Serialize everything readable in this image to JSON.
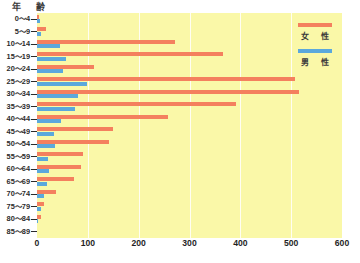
{
  "chart_data": {
    "type": "bar",
    "orientation": "horizontal",
    "title": "",
    "xlabel": "",
    "ylabel": "年　齢",
    "categories": [
      "0～4",
      "5～9",
      "10～14",
      "15～19",
      "20～24",
      "25～29",
      "30～34",
      "35～39",
      "40～44",
      "45～49",
      "50～54",
      "55～59",
      "60～64",
      "65～69",
      "70～74",
      "75～79",
      "80～84",
      "85～89"
    ],
    "series": [
      {
        "name": "女　性",
        "color": "#F4805E",
        "values": [
          4,
          18,
          272,
          365,
          113,
          508,
          515,
          392,
          258,
          150,
          142,
          90,
          87,
          72,
          38,
          14,
          7,
          0
        ]
      },
      {
        "name": "男　性",
        "color": "#5BA8DC",
        "values": [
          6,
          7,
          46,
          57,
          52,
          98,
          81,
          74,
          47,
          33,
          36,
          22,
          24,
          19,
          13,
          8,
          1,
          0
        ]
      }
    ],
    "xlim": [
      0,
      600
    ],
    "xticks": [
      0,
      100,
      200,
      300,
      400,
      500,
      600
    ],
    "xtick_labels": [
      "0",
      "100",
      "200",
      "300",
      "400",
      "500",
      "600"
    ],
    "grid": true,
    "grid_axis": "x",
    "grid_color": "#ffffff",
    "plot_background": "#FAF8A8",
    "legend_position": "top-right"
  },
  "axis": {
    "age_caption": "年　齢"
  },
  "legend": {
    "items": [
      {
        "label": "女　性",
        "color": "#F4805E"
      },
      {
        "label": "男　性",
        "color": "#5BA8DC"
      }
    ]
  },
  "caption": {
    "text": ""
  }
}
